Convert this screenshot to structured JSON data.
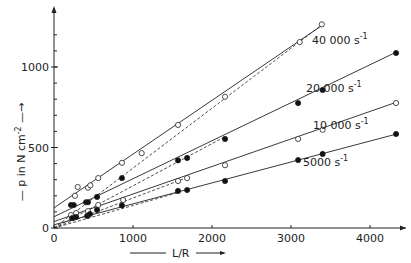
{
  "chart_data": {
    "type": "scatter",
    "title": "",
    "xlabel": "L/R",
    "ylabel": "p in N cm^-2",
    "xlim": [
      0,
      4500
    ],
    "ylim": [
      0,
      1300
    ],
    "x_ticks": [
      0,
      1000,
      2000,
      3000,
      4000
    ],
    "y_ticks": [
      0,
      500,
      1000
    ],
    "y_minor_step": 100,
    "grid": false,
    "legend": "inline labels at line ends",
    "series": [
      {
        "name": "40 000 s^-1",
        "label_main": "40 000 s",
        "label_exp": "-1",
        "marker": "open",
        "fit": {
          "intercept": 125,
          "slope": 0.334
        },
        "dashed": {
          "intercept": 0,
          "slope": 0.372,
          "x_end": 3390
        },
        "x": [
          265,
          300,
          430,
          460,
          560,
          860,
          1110,
          1570,
          2165,
          3110,
          3390
        ],
        "y": [
          200,
          255,
          250,
          265,
          310,
          405,
          465,
          640,
          815,
          1155,
          1265
        ]
      },
      {
        "name": "20 000 s^-1",
        "label_main": "20 000 s",
        "label_exp": "-1",
        "marker": "filled",
        "fit": {
          "intercept": 70,
          "slope": 0.236
        },
        "dashed": {
          "intercept": 0,
          "slope": 0.262,
          "x_end": 2165
        },
        "x": [
          215,
          250,
          405,
          430,
          545,
          860,
          1570,
          1685,
          2165,
          3090,
          3400,
          4330
        ],
        "y": [
          143,
          143,
          160,
          160,
          193,
          310,
          420,
          435,
          553,
          776,
          857,
          1087
        ]
      },
      {
        "name": "10 000 s^-1",
        "label_main": "10 000 s",
        "label_exp": "-1",
        "marker": "open",
        "fit": {
          "intercept": 40,
          "slope": 0.171
        },
        "dashed": {
          "intercept": 0,
          "slope": 0.186,
          "x_end": 1685
        },
        "x": [
          215,
          280,
          430,
          560,
          875,
          1570,
          1685,
          2165,
          3090,
          3400,
          4330
        ],
        "y": [
          80,
          93,
          105,
          143,
          174,
          292,
          310,
          390,
          553,
          610,
          776
        ]
      },
      {
        "name": "5000 s^-1",
        "label_main": "5000 s",
        "label_exp": "-1",
        "marker": "filled",
        "fit": {
          "intercept": 20,
          "slope": 0.13
        },
        "dashed": {
          "intercept": 0,
          "slope": 0.14,
          "x_end": 1570
        },
        "x": [
          230,
          280,
          420,
          455,
          545,
          860,
          1570,
          1685,
          2165,
          3090,
          3400,
          4330
        ],
        "y": [
          62,
          68,
          75,
          87,
          112,
          140,
          230,
          236,
          292,
          422,
          460,
          584
        ]
      }
    ]
  },
  "axes": {
    "x_label": "L/R",
    "y_label_main": "p  in  N cm",
    "y_label_exp": "-2"
  }
}
